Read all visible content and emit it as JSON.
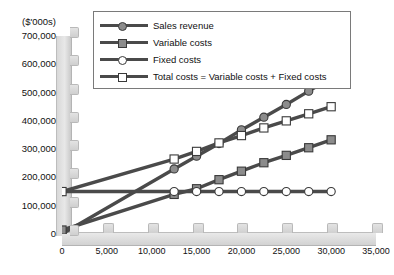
{
  "chart_data": {
    "type": "line",
    "title": "",
    "subtitle": "",
    "xlabel": "",
    "ylabel": "($'000s)",
    "unit_label": "($'000s)",
    "grid": false,
    "legend_position": "top",
    "xlim": [
      0,
      35000
    ],
    "ylim": [
      0,
      700000
    ],
    "x_ticks": [
      0,
      5000,
      10000,
      15000,
      20000,
      25000,
      30000,
      35000
    ],
    "x_tick_labels": [
      "0",
      "5,000",
      "10,000",
      "15,000",
      "20,000",
      "25,000",
      "30,000",
      "35,000"
    ],
    "y_ticks": [
      0,
      100000,
      200000,
      300000,
      400000,
      500000,
      600000,
      700000
    ],
    "y_tick_labels": [
      "0",
      "100,000",
      "200,000",
      "300,000",
      "400,000",
      "500,000",
      "600,000",
      "700,000"
    ],
    "x": [
      0,
      12500,
      15000,
      17500,
      20000,
      22500,
      25000,
      27500,
      30000
    ],
    "series": [
      {
        "name": "Sales revenue",
        "marker": "circle",
        "marker_fill": "#8c8c8c",
        "line_color": "#4a4a4a",
        "values": [
          0,
          230000,
          275000,
          320000,
          368000,
          413000,
          458000,
          505000,
          551000
        ]
      },
      {
        "name": "Variable costs",
        "marker": "square",
        "marker_fill": "#8c8c8c",
        "line_color": "#4a4a4a",
        "values": [
          14000,
          140000,
          160000,
          192000,
          222000,
          252000,
          278000,
          305000,
          333000
        ]
      },
      {
        "name": "Fixed costs",
        "marker": "circle",
        "marker_fill": "#ffffff",
        "line_color": "#4a4a4a",
        "values": [
          150000,
          150000,
          150000,
          150000,
          150000,
          150000,
          150000,
          150000,
          150000
        ]
      },
      {
        "name": "Total costs = Variable costs + Fixed costs",
        "marker": "square",
        "marker_fill": "#ffffff",
        "line_color": "#4a4a4a",
        "values": [
          150000,
          265000,
          292000,
          322000,
          348000,
          375000,
          400000,
          425000,
          450000
        ]
      }
    ]
  },
  "legend": {
    "items": [
      {
        "label": "Sales revenue",
        "marker": "circle",
        "fill": "#8c8c8c"
      },
      {
        "label": "Variable costs",
        "marker": "square",
        "fill": "#8c8c8c"
      },
      {
        "label": "Fixed costs",
        "marker": "circle",
        "fill": "#ffffff"
      },
      {
        "label": "Total costs = Variable costs + Fixed costs",
        "marker": "square",
        "fill": "#ffffff"
      }
    ]
  },
  "colors": {
    "line": "#4a4a4a",
    "marker_gray": "#8c8c8c",
    "marker_white": "#ffffff",
    "axis_band": "#d8d8d8",
    "background": "#ffffff",
    "text": "#111111"
  }
}
